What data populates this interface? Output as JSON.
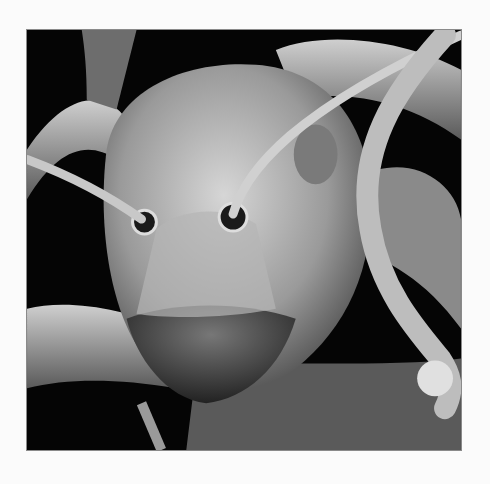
{
  "image": {
    "subject": "scanning electron micrograph of an ant head",
    "alt": "Close-up grayscale SEM image of an ant head with antennae on a black background",
    "background_color": "#050505",
    "page_background": "#fbfbfb",
    "border_color": "#8a8a8a"
  }
}
